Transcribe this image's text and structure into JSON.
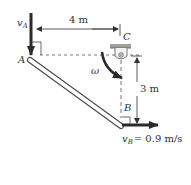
{
  "diagram": {
    "type": "rigid-body kinematics",
    "labels": {
      "point_a": "A",
      "point_b": "B",
      "point_c": "C",
      "v_a": "v",
      "v_a_sub": "A",
      "v_b": "v",
      "v_b_sub": "B",
      "v_b_value": "= 0.9 m/s",
      "omega": "ω",
      "dim_horizontal": "4 m",
      "dim_vertical": "3 m"
    },
    "colors": {
      "line": "#333333",
      "arrow": "#2a2a2a",
      "support": "#9a9a9a",
      "background": "#ffffff"
    }
  }
}
